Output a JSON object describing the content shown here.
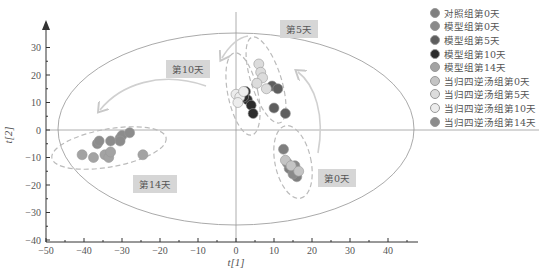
{
  "chart_data": {
    "type": "scatter",
    "title": "",
    "xlabel": "t[1]",
    "ylabel": "t[2]",
    "xlim": [
      -50,
      48
    ],
    "ylim": [
      -40,
      38
    ],
    "x_ticks": [
      -50,
      -40,
      -30,
      -20,
      -10,
      0,
      10,
      20,
      30,
      40
    ],
    "y_ticks": [
      -40,
      -30,
      -20,
      -10,
      0,
      10,
      20,
      30
    ],
    "grid": false,
    "legend_position": "right",
    "annotations": [
      "第0天",
      "第5天",
      "第10天",
      "第14天"
    ],
    "series": [
      {
        "name": "对照组第0天",
        "color": "#7f7f7f",
        "points": [
          [
            12.5,
            -7
          ],
          [
            14,
            -14
          ],
          [
            16,
            -17
          ]
        ]
      },
      {
        "name": "模型组第0天",
        "color": "#8a8a8a",
        "points": [
          [
            13.5,
            -12
          ],
          [
            15,
            -16
          ],
          [
            15.5,
            -13
          ]
        ]
      },
      {
        "name": "模型组第5天",
        "color": "#5e5e5e",
        "points": [
          [
            9.5,
            16
          ],
          [
            11,
            15
          ],
          [
            10,
            8
          ],
          [
            13,
            6
          ]
        ]
      },
      {
        "name": "模型组第10天",
        "color": "#2b2b2b",
        "points": [
          [
            2.5,
            14
          ],
          [
            3,
            11
          ],
          [
            4,
            9
          ],
          [
            4.5,
            6
          ],
          [
            2,
            12
          ]
        ]
      },
      {
        "name": "模型组第14天",
        "color": "#a3a3a3",
        "points": [
          [
            -40.5,
            -9
          ],
          [
            -37.5,
            -10
          ],
          [
            -34.5,
            -9
          ],
          [
            -33.5,
            -10
          ],
          [
            -33,
            -8
          ],
          [
            -24.5,
            -9
          ]
        ]
      },
      {
        "name": "当归四逆汤组第0天",
        "color": "#c4c4c4",
        "points": [
          [
            13,
            -11
          ],
          [
            14.5,
            -13
          ],
          [
            16.5,
            -15
          ]
        ]
      },
      {
        "name": "当归四逆汤组第5天",
        "color": "#dcdcdc",
        "points": [
          [
            6,
            24
          ],
          [
            6.5,
            21
          ],
          [
            7,
            19
          ],
          [
            5.5,
            17
          ],
          [
            8,
            15
          ]
        ]
      },
      {
        "name": "当归四逆汤组第10天",
        "color": "#ececec",
        "points": [
          [
            0,
            13
          ],
          [
            1,
            12
          ],
          [
            0.5,
            10
          ],
          [
            2,
            14
          ]
        ]
      },
      {
        "name": "当归四逆汤组第14天",
        "color": "#8c8c8c",
        "points": [
          [
            -36.5,
            -5
          ],
          [
            -36,
            -4
          ],
          [
            -33,
            -4
          ],
          [
            -30.5,
            -3
          ],
          [
            -30,
            -2
          ],
          [
            -28,
            -1
          ],
          [
            -30.5,
            -4
          ]
        ]
      }
    ]
  },
  "axes": {
    "x_label": "t[1]",
    "y_label": "t[2]",
    "x_ticks": [
      "−50",
      "−40",
      "−30",
      "−20",
      "−10",
      "0",
      "10",
      "20",
      "30",
      "40"
    ],
    "y_ticks": [
      "30",
      "20",
      "10",
      "0",
      "−10",
      "−20",
      "−30",
      "−40"
    ]
  },
  "labels": {
    "day0": "第0天",
    "day5": "第5天",
    "day10": "第10天",
    "day14": "第14天"
  },
  "legend": [
    {
      "label": "对照组第0天",
      "color": "#7f7f7f"
    },
    {
      "label": "模型组第0天",
      "color": "#8a8a8a"
    },
    {
      "label": "模型组第5天",
      "color": "#5e5e5e"
    },
    {
      "label": "模型组第10天",
      "color": "#2b2b2b"
    },
    {
      "label": "模型组第14天",
      "color": "#a3a3a3"
    },
    {
      "label": "当归四逆汤组第0天",
      "color": "#c4c4c4"
    },
    {
      "label": "当归四逆汤组第5天",
      "color": "#dcdcdc"
    },
    {
      "label": "当归四逆汤组第10天",
      "color": "#ececec"
    },
    {
      "label": "当归四逆汤组第14天",
      "color": "#8c8c8c"
    }
  ]
}
